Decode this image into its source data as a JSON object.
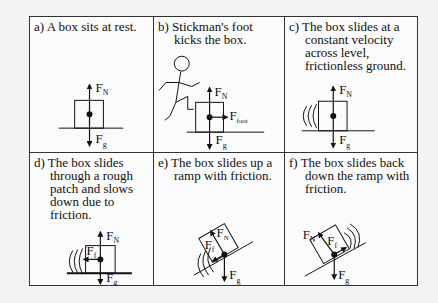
{
  "panels": [
    {
      "id": "a",
      "caption": "a) A box sits at rest.",
      "forces": [
        "F_N",
        "F_g"
      ],
      "labels": {
        "fn": "F",
        "fn_sub": "N",
        "fg": "F",
        "fg_sub": "g"
      }
    },
    {
      "id": "b",
      "caption": "b) Stickman's foot kicks the box.",
      "forces": [
        "F_N",
        "F_g",
        "F_foot"
      ],
      "labels": {
        "fn": "F",
        "fn_sub": "N",
        "fg": "F",
        "fg_sub": "g",
        "ffoot": "F",
        "ffoot_sub": "foot"
      }
    },
    {
      "id": "c",
      "caption": "c) The box slides at a constant velocity across level, frictionless ground.",
      "forces": [
        "F_N",
        "F_g"
      ],
      "labels": {
        "fn": "F",
        "fn_sub": "N",
        "fg": "F",
        "fg_sub": "g"
      }
    },
    {
      "id": "d",
      "caption": "d) The box slides through a rough patch and slows down due to friction.",
      "forces": [
        "F_N",
        "F_g",
        "F_f"
      ],
      "labels": {
        "fn": "F",
        "fn_sub": "N",
        "fg": "F",
        "fg_sub": "g",
        "ff": "F",
        "ff_sub": "f"
      }
    },
    {
      "id": "e",
      "caption": "e) The box slides up a ramp with friction.",
      "forces": [
        "F_N",
        "F_g",
        "F_f"
      ],
      "labels": {
        "fn": "F",
        "fn_sub": "N",
        "fg": "F",
        "fg_sub": "g",
        "ff": "F",
        "ff_sub": "f"
      }
    },
    {
      "id": "f",
      "caption": "f) The box slides back down the ramp with friction.",
      "forces": [
        "F_N",
        "F_g",
        "F_f"
      ],
      "labels": {
        "fn": "F",
        "fn_sub": "N",
        "fg": "F",
        "fg_sub": "g",
        "ff": "F",
        "ff_sub": "f"
      }
    }
  ],
  "colors": {
    "background": "#f3f3f3",
    "line": "#111111",
    "border": "#333333"
  }
}
